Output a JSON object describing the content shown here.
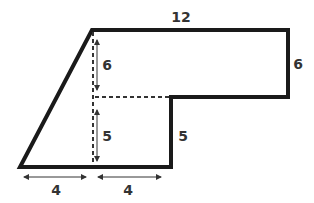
{
  "diagram": {
    "type": "composite-shape-area",
    "labels": {
      "top": "12",
      "right": "6",
      "inner_step": "5",
      "upper_height": "6",
      "lower_height": "5",
      "bottom_left": "4",
      "bottom_right": "4"
    },
    "colors": {
      "outline": "#1a1a1a",
      "dashed": "#333333",
      "text": "#333333"
    }
  }
}
